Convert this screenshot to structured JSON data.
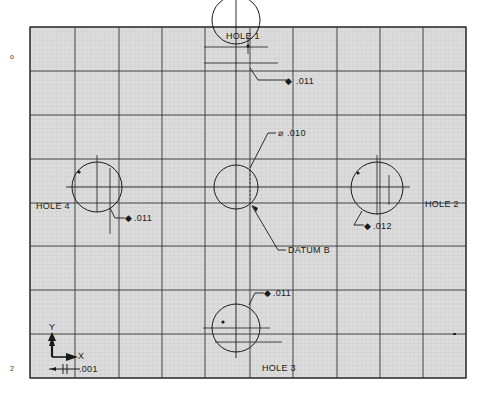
{
  "drawing": {
    "frame": {
      "x": 30,
      "y": 27,
      "width": 436,
      "height": 351
    },
    "colors": {
      "paper": "#d9d9d9",
      "fine_grid": "#9a9a9a",
      "major_grid": "#333333",
      "ink": "#1a1a1a",
      "background": "#ffffff"
    },
    "major_grid_x": [
      30,
      75,
      119,
      162,
      205,
      250,
      293,
      337,
      380,
      423,
      466
    ],
    "major_grid_y": [
      27,
      71,
      115,
      159,
      203,
      246,
      290,
      334,
      378
    ],
    "margin_marks": [
      {
        "text": "o",
        "x": 12,
        "y": 57
      },
      {
        "text": "2",
        "x": 12,
        "y": 369
      }
    ],
    "holes": [
      {
        "id": "hole-1",
        "label": "HOLE 1",
        "tolerance": ".011",
        "cx": 236,
        "cy": 20,
        "r": 24,
        "label_x": 216,
        "label_y": 37,
        "tol_x": 290,
        "tol_y": 82
      },
      {
        "id": "hole-2",
        "label": "HOLE 2",
        "tolerance": ".012",
        "cx": 377,
        "cy": 188,
        "r": 26,
        "label_x": 425,
        "label_y": 206,
        "tol_x": 368,
        "tol_y": 230
      },
      {
        "id": "hole-3",
        "label": "HOLE 3",
        "tolerance": ".011",
        "cx": 236,
        "cy": 328,
        "r": 24,
        "label_x": 262,
        "label_y": 371,
        "tol_x": 274,
        "tol_y": 297
      },
      {
        "id": "hole-4",
        "label": "HOLE 4",
        "tolerance": ".011",
        "cx": 97,
        "cy": 187,
        "r": 25,
        "label_x": 36,
        "label_y": 208,
        "tol_x": 125,
        "tol_y": 220
      }
    ],
    "datum": {
      "label": "DATUM B",
      "tolerance": ".010",
      "cx": 236,
      "cy": 187,
      "r": 22,
      "label_x": 278,
      "label_y": 252,
      "tol_x": 277,
      "tol_y": 134
    },
    "axes": {
      "y_label": "Y",
      "x_label": "X",
      "scale_label": ".001"
    },
    "symbols": {
      "position_tolerance": "⌖"
    }
  }
}
